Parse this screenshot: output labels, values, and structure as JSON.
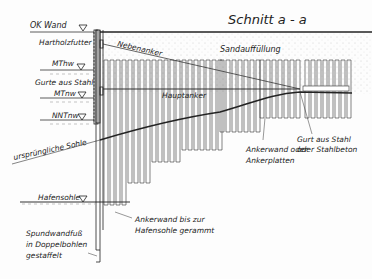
{
  "title": "Schnitt  a - a",
  "levels": [
    {
      "label": "OK Wand",
      "y": 32
    },
    {
      "label": "MThw",
      "y": 70
    },
    {
      "label": "MTnw",
      "y": 97
    },
    {
      "label": "NNTnw",
      "y": 118
    },
    {
      "label": "Hafensohle",
      "y": 202
    }
  ],
  "annotations": {
    "hartholzfutter": "Hartholzfutter",
    "nebenanker": "Nebenanker",
    "sandauffuellung": "Sandauffüllung",
    "gurte_stahl": "Gurte aus Stahl",
    "hauptanker": "Hauptanker",
    "ursprungliche_sohle": "ursprüngliche Sohle",
    "ankerwand_1": "Ankerwand oder",
    "ankerwand_2": "Ankerplatten",
    "gurt_1": "Gurt aus Stahl",
    "gurt_2": "oder Stahlbeton",
    "ankerwand_bis_1": "Ankerwand bis zur",
    "ankerwand_bis_2": "Hafensohle gerammt",
    "spund_1": "Spundwandfuß",
    "spund_2": "in Doppelbohlen",
    "spund_3": "gestaffelt"
  }
}
